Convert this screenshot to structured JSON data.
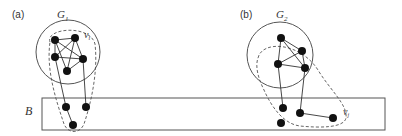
{
  "panels": [
    {
      "label": "(a)",
      "graph_label": "G",
      "graph_subscript": "1",
      "vertex_label": "v",
      "vertex_subscript": "i"
    },
    {
      "label": "(b)",
      "graph_label": "G",
      "graph_subscript": "2",
      "vertex_label": "v",
      "vertex_subscript": "j"
    }
  ],
  "region": {
    "label": "B"
  },
  "colors": {
    "stroke": "#333333",
    "node": "#111111",
    "background": "#ffffff"
  }
}
